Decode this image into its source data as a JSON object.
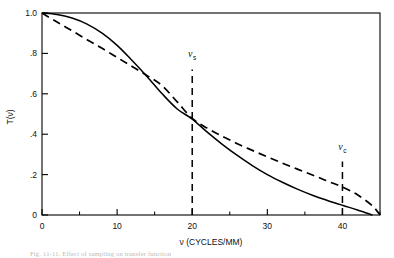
{
  "chart_data": {
    "type": "line",
    "title": "",
    "xlabel": "ν (CYCLES/MM)",
    "ylabel": "T(ν)",
    "xlim": [
      0,
      45
    ],
    "ylim": [
      0,
      1.0
    ],
    "grid": false,
    "legend_position": "none",
    "x_ticks": [
      0,
      10,
      20,
      30,
      40
    ],
    "x_tick_labels": [
      "0",
      "10",
      "20",
      "30",
      "40"
    ],
    "x_minor_ticks": [
      5,
      15,
      25,
      35,
      45
    ],
    "y_ticks": [
      0,
      0.2,
      0.4,
      0.6,
      0.8,
      1.0
    ],
    "y_tick_labels": [
      "0",
      ".2",
      ".4",
      ".6",
      ".8",
      "1.0"
    ],
    "series": [
      {
        "name": "solid-mtf-curve",
        "style": "solid",
        "color": "#000000",
        "x": [
          0,
          2,
          4,
          6,
          8,
          10,
          12,
          14,
          16,
          18,
          20,
          22,
          24,
          26,
          28,
          30,
          32,
          34,
          36,
          38,
          40,
          42,
          44
        ],
        "values": [
          1.0,
          0.993,
          0.975,
          0.945,
          0.9,
          0.84,
          0.765,
          0.685,
          0.6,
          0.525,
          0.475,
          0.41,
          0.35,
          0.295,
          0.245,
          0.2,
          0.162,
          0.128,
          0.098,
          0.072,
          0.048,
          0.025,
          0.0
        ]
      },
      {
        "name": "dashed-mtf-curve",
        "style": "dashed",
        "color": "#000000",
        "x": [
          0,
          2,
          4,
          6,
          8,
          10,
          12,
          14,
          16,
          18,
          20,
          22,
          24,
          26,
          28,
          30,
          32,
          34,
          36,
          38,
          40,
          42,
          44,
          45
        ],
        "values": [
          1.0,
          0.955,
          0.912,
          0.868,
          0.825,
          0.78,
          0.735,
          0.69,
          0.64,
          0.56,
          0.478,
          0.43,
          0.39,
          0.353,
          0.32,
          0.288,
          0.257,
          0.227,
          0.198,
          0.168,
          0.138,
          0.1,
          0.045,
          0.0
        ]
      }
    ],
    "annotations": [
      {
        "name": "nu-s-marker",
        "symbol": "ν",
        "subscript": "s",
        "x": 20,
        "line_from_y": 0.0,
        "line_to_y": 0.72,
        "label_y": 0.78,
        "style": "dashed"
      },
      {
        "name": "nu-c-marker",
        "symbol": "ν",
        "subscript": "c",
        "x": 40,
        "line_from_y": 0.0,
        "line_to_y": 0.265,
        "label_y": 0.32,
        "style": "dashed"
      }
    ]
  },
  "caption": {
    "text": "Fig. 11-11. Effect of sampling on transfer function"
  }
}
